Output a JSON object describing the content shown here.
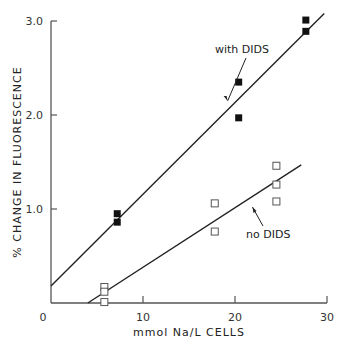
{
  "chart_data": {
    "type": "scatter",
    "title": "",
    "xlabel": "mmol Na/L CELLS",
    "ylabel": "% CHANGE IN FLUORESCENCE",
    "xlim": [
      0,
      30
    ],
    "ylim": [
      0,
      3.0
    ],
    "x_ticks": [
      0,
      10,
      20,
      30
    ],
    "x_tick_labels": [
      "0",
      "10",
      "20",
      "30"
    ],
    "y_ticks": [
      1.0,
      2.0,
      3.0
    ],
    "y_tick_labels": [
      "1.0",
      "2.0",
      "3.0"
    ],
    "grid": false,
    "legend_position": "inline annotations",
    "series": [
      {
        "name": "with DIDS",
        "marker": "filled-square",
        "points": [
          {
            "x": 7.2,
            "y": 0.95
          },
          {
            "x": 7.2,
            "y": 0.86
          },
          {
            "x": 20.4,
            "y": 2.35
          },
          {
            "x": 20.4,
            "y": 1.97
          },
          {
            "x": 27.7,
            "y": 3.01
          },
          {
            "x": 27.7,
            "y": 2.89
          }
        ],
        "fit_line": {
          "x0": 0,
          "y0": 0.18,
          "x1": 29.7,
          "y1": 3.08
        }
      },
      {
        "name": "no DIDS",
        "marker": "open-square",
        "points": [
          {
            "x": 5.8,
            "y": 0.17
          },
          {
            "x": 5.8,
            "y": 0.12
          },
          {
            "x": 5.8,
            "y": 0.01
          },
          {
            "x": 17.8,
            "y": 1.06
          },
          {
            "x": 17.8,
            "y": 0.76
          },
          {
            "x": 24.5,
            "y": 1.46
          },
          {
            "x": 24.5,
            "y": 1.26
          },
          {
            "x": 24.5,
            "y": 1.08
          }
        ],
        "fit_line": {
          "x0": 4.0,
          "y0": 0.0,
          "x1": 27.2,
          "y1": 1.47
        }
      }
    ],
    "annotations": [
      {
        "text": "with DIDS",
        "arrow_to": {
          "x": 19.2,
          "y": 2.15
        }
      },
      {
        "text": "no DIDS",
        "arrow_to": {
          "x": 21.9,
          "y": 1.02
        }
      }
    ]
  },
  "colors": {
    "axis": "#555555",
    "line": "#222222",
    "marker_fill": "#111111",
    "marker_open_stroke": "#555555"
  }
}
